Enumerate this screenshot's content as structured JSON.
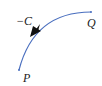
{
  "diagram": {
    "curve_label": "−C",
    "start_point_label": "Q",
    "end_point_label": "P",
    "curve_color": "#4a6fbf",
    "arrow_color": "#111111",
    "direction": "from Q to P"
  }
}
